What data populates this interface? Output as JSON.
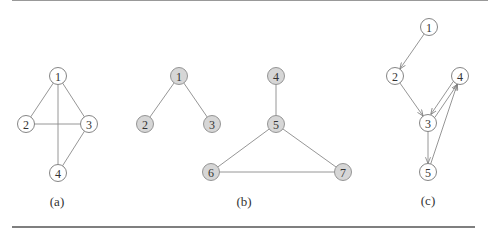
{
  "colors": {
    "edge": "#8a8a8a",
    "node_white_fill": "#ffffff",
    "node_gray_fill": "#d6d6d6",
    "text": "#333333"
  },
  "graphs": [
    {
      "id": "a",
      "caption": "(a)",
      "directed": false,
      "node_style": "white",
      "nodes": [
        {
          "label": "1",
          "x": 58,
          "y": 76
        },
        {
          "label": "2",
          "x": 26,
          "y": 124
        },
        {
          "label": "3",
          "x": 89,
          "y": 124
        },
        {
          "label": "4",
          "x": 58,
          "y": 173
        }
      ],
      "edges": [
        [
          "1",
          "2"
        ],
        [
          "1",
          "3"
        ],
        [
          "1",
          "4"
        ],
        [
          "2",
          "3"
        ],
        [
          "3",
          "4"
        ]
      ]
    },
    {
      "id": "b",
      "caption": "(b)",
      "directed": false,
      "node_style": "gray",
      "nodes": [
        {
          "label": "1",
          "x": 179,
          "y": 76
        },
        {
          "label": "2",
          "x": 145,
          "y": 124
        },
        {
          "label": "3",
          "x": 212,
          "y": 124
        },
        {
          "label": "4",
          "x": 276,
          "y": 76
        },
        {
          "label": "5",
          "x": 276,
          "y": 124
        },
        {
          "label": "6",
          "x": 211,
          "y": 172
        },
        {
          "label": "7",
          "x": 343,
          "y": 172
        }
      ],
      "edges": [
        [
          "1",
          "2"
        ],
        [
          "1",
          "3"
        ],
        [
          "4",
          "5"
        ],
        [
          "5",
          "6"
        ],
        [
          "5",
          "7"
        ],
        [
          "6",
          "7"
        ]
      ]
    },
    {
      "id": "c",
      "caption": "(c)",
      "directed": true,
      "node_style": "white",
      "nodes": [
        {
          "label": "1",
          "x": 429,
          "y": 27
        },
        {
          "label": "2",
          "x": 395,
          "y": 76
        },
        {
          "label": "3",
          "x": 428,
          "y": 123
        },
        {
          "label": "4",
          "x": 460,
          "y": 76
        },
        {
          "label": "5",
          "x": 428,
          "y": 172
        }
      ],
      "edges": [
        [
          "1",
          "2"
        ],
        [
          "2",
          "3"
        ],
        [
          "3",
          "4"
        ],
        [
          "4",
          "3"
        ],
        [
          "3",
          "5"
        ],
        [
          "5",
          "4"
        ]
      ]
    }
  ],
  "captions": {
    "a": "(a)",
    "b": "(b)",
    "c": "(c)"
  }
}
